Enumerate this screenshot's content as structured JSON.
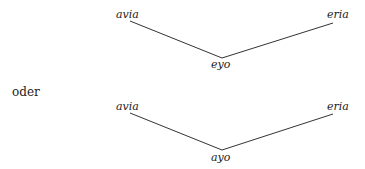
{
  "diagram_top": {
    "left": "avia",
    "right": "eria",
    "bottom": "eyo"
  },
  "connector": "oder",
  "diagram_bottom": {
    "left": "avia",
    "right": "eria",
    "bottom": "ayo"
  }
}
